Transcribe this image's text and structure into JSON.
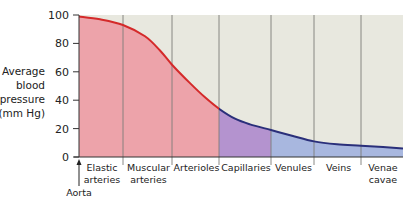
{
  "chart_data": {
    "type": "area",
    "title": "",
    "xlabel": "",
    "ylabel": "Average blood pressure (mm Hg)",
    "ylabel_lines": [
      "Average",
      "blood",
      "pressure",
      "(mm Hg)"
    ],
    "ylim": [
      0,
      100
    ],
    "yticks": [
      0,
      20,
      40,
      60,
      80,
      100
    ],
    "grid": false,
    "legend": null,
    "categories": [
      {
        "label_lines": [
          "Elastic",
          "arteries"
        ],
        "x0": 79,
        "x1": 123,
        "color": "#eda3aa"
      },
      {
        "label_lines": [
          "Muscular",
          "arteries"
        ],
        "x0": 123,
        "x1": 172,
        "color": "#eda3aa"
      },
      {
        "label_lines": [
          "Arterioles"
        ],
        "x0": 172,
        "x1": 219,
        "color": "#eda3aa"
      },
      {
        "label_lines": [
          "Capillaries"
        ],
        "x0": 219,
        "x1": 271,
        "color": "#b493cf"
      },
      {
        "label_lines": [
          "Venules"
        ],
        "x0": 271,
        "x1": 314,
        "color": "#a8b7df"
      },
      {
        "label_lines": [
          "Veins"
        ],
        "x0": 314,
        "x1": 361,
        "color": "#a8b7df"
      },
      {
        "label_lines": [
          "Venae",
          "cavae"
        ],
        "x0": 361,
        "x1": 403,
        "color": "#a8b7df"
      }
    ],
    "series": [
      {
        "name": "Average blood pressure",
        "points": [
          {
            "x": 79,
            "y": 99
          },
          {
            "x": 100,
            "y": 97
          },
          {
            "x": 123,
            "y": 93
          },
          {
            "x": 145,
            "y": 85
          },
          {
            "x": 160,
            "y": 75
          },
          {
            "x": 172,
            "y": 65
          },
          {
            "x": 190,
            "y": 52
          },
          {
            "x": 205,
            "y": 42
          },
          {
            "x": 219,
            "y": 34
          },
          {
            "x": 235,
            "y": 27
          },
          {
            "x": 250,
            "y": 23
          },
          {
            "x": 271,
            "y": 19
          },
          {
            "x": 292,
            "y": 15
          },
          {
            "x": 314,
            "y": 11
          },
          {
            "x": 337,
            "y": 9
          },
          {
            "x": 361,
            "y": 8
          },
          {
            "x": 383,
            "y": 7
          },
          {
            "x": 403,
            "y": 6
          }
        ]
      }
    ],
    "annotations": [
      {
        "text": "Aorta",
        "x": 79,
        "arrow": true
      }
    ],
    "colors": {
      "background": "#e8e8df",
      "arterial_line": "#d42a2a",
      "venous_line": "#2a2f7a",
      "arterial_fill": "#eda3aa",
      "capillary_fill": "#b493cf",
      "venous_fill": "#a8b7df",
      "divider": "#7d7d78",
      "axis": "#333333"
    }
  }
}
